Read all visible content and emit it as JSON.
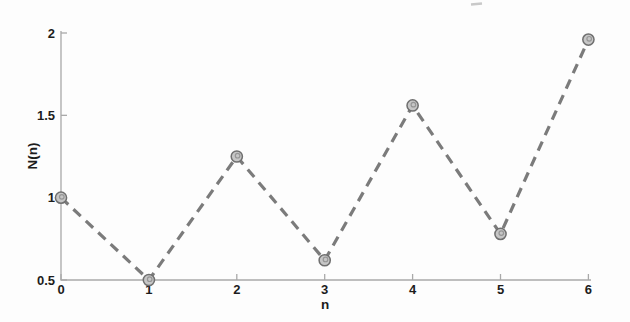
{
  "figure": {
    "background": "#fdfdfd"
  },
  "chart_data": {
    "type": "line",
    "title": "",
    "xlabel": "n",
    "ylabel": "N(n)",
    "x": [
      0,
      1,
      2,
      3,
      4,
      5,
      6
    ],
    "values": [
      1.0,
      0.5,
      1.25,
      0.62,
      1.56,
      0.78,
      1.96
    ],
    "xlim": [
      0,
      6
    ],
    "ylim": [
      0.5,
      2
    ],
    "x_tick_values": [
      0,
      1,
      2,
      3,
      4,
      5,
      6
    ],
    "x_tick_labels": [
      "0",
      "1",
      "2",
      "3",
      "4",
      "5",
      "6"
    ],
    "y_tick_values": [
      0.5,
      1,
      1.5,
      2
    ],
    "y_tick_labels": [
      "0.5",
      "1",
      "1.5",
      "2"
    ],
    "grid": false,
    "legend": "none",
    "line_style": "dashed",
    "marker": "circle-filled",
    "colors": {
      "line": "#7b7b7b",
      "marker_fill": "#c6c6c6",
      "marker_edge": "#6f6f6f",
      "marker_smudge": "#828282",
      "axis": "#a9a9a9",
      "tick_text": "#1c1c1c",
      "artifact": "#c9c9c9"
    }
  }
}
